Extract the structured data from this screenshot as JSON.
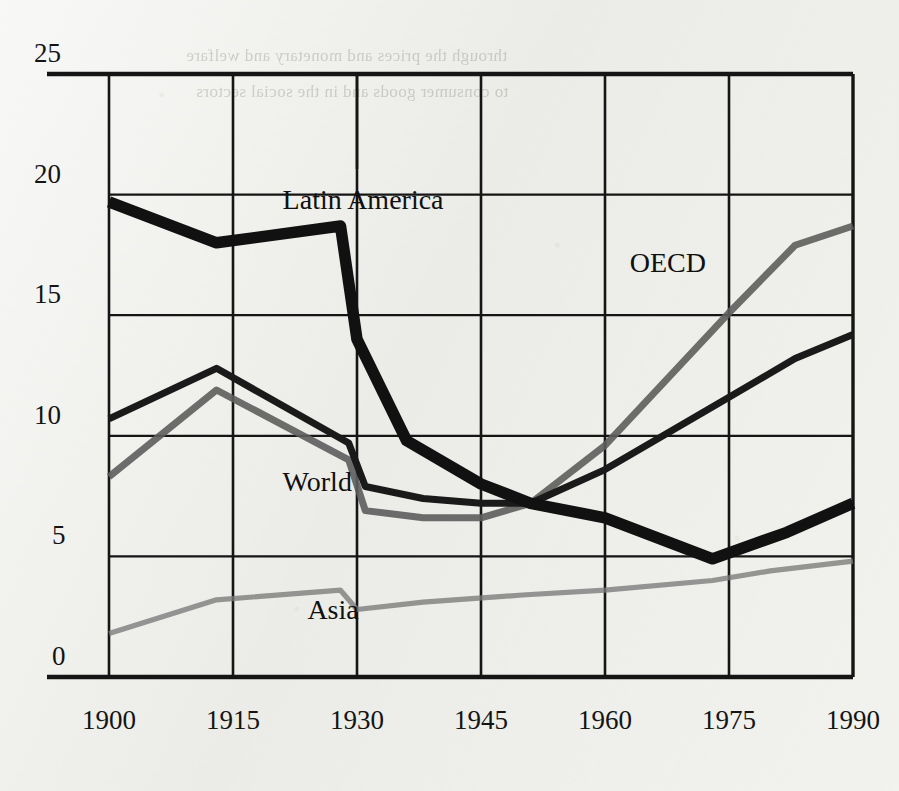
{
  "chart_data": {
    "type": "line",
    "title": "",
    "xlabel": "",
    "ylabel": "",
    "xlim": [
      1900,
      1990
    ],
    "ylim": [
      0,
      25
    ],
    "xticks": [
      "1900",
      "1915",
      "1930",
      "1945",
      "1960",
      "1975",
      "1990"
    ],
    "yticks": [
      "0",
      "5",
      "10",
      "15",
      "20",
      "25"
    ],
    "grid": true,
    "legend_position": "inline-annotations",
    "series": [
      {
        "name": "Latin America",
        "style": "thick-black",
        "color": "#111111",
        "x": [
          1900,
          1913,
          1928,
          1930,
          1936,
          1945,
          1951,
          1960,
          1973,
          1982,
          1990
        ],
        "y": [
          19.7,
          18.0,
          18.7,
          14.0,
          9.8,
          8.0,
          7.2,
          6.6,
          4.9,
          6.0,
          7.2
        ]
      },
      {
        "name": "World",
        "style": "medium-black",
        "color": "#1a1a1a",
        "x": [
          1900,
          1913,
          1929,
          1931,
          1938,
          1945,
          1951,
          1960,
          1975,
          1983,
          1990
        ],
        "y": [
          10.7,
          12.8,
          9.7,
          7.9,
          7.4,
          7.2,
          7.2,
          8.6,
          11.6,
          13.2,
          14.2
        ]
      },
      {
        "name": "OECD",
        "style": "medium-grey",
        "color": "#5d5d5d",
        "x": [
          1900,
          1913,
          1929,
          1931,
          1938,
          1945,
          1951,
          1960,
          1975,
          1983,
          1990
        ],
        "y": [
          8.3,
          11.9,
          9.0,
          6.9,
          6.6,
          6.6,
          7.2,
          9.6,
          15.1,
          17.9,
          18.7
        ]
      },
      {
        "name": "Asia",
        "style": "thin-grey",
        "color": "#7a7a7a",
        "x": [
          1900,
          1913,
          1928,
          1930,
          1938,
          1950,
          1960,
          1973,
          1980,
          1990
        ],
        "y": [
          1.8,
          3.2,
          3.6,
          2.8,
          3.1,
          3.4,
          3.6,
          4.0,
          4.4,
          4.8
        ]
      }
    ],
    "annotations": [
      {
        "text": "Latin America",
        "x": 1921,
        "y": 19.6
      },
      {
        "text": "OECD",
        "x": 1963,
        "y": 17.0
      },
      {
        "text": "World",
        "x": 1921,
        "y": 7.9
      },
      {
        "text": "Asia",
        "x": 1924,
        "y": 2.6
      }
    ]
  },
  "page_bleed": [
    "through the prices and monetary and welfare",
    "to consumer goods and in the social sectors"
  ]
}
